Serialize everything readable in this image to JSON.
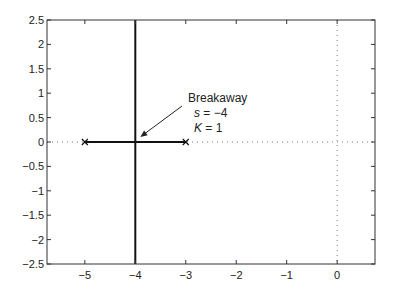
{
  "chart_data": {
    "type": "line",
    "title": "",
    "xlabel": "",
    "ylabel": "",
    "xlim": [
      -5.75,
      0.75
    ],
    "ylim": [
      -2.5,
      2.5
    ],
    "grid": false,
    "legend": null,
    "x_ticks": [
      -5,
      -4,
      -3,
      -2,
      -1,
      0
    ],
    "x_tick_labels": [
      "−5",
      "−4",
      "−3",
      "−2",
      "−1",
      "0"
    ],
    "y_ticks": [
      2.5,
      2,
      1.5,
      1,
      0.5,
      0,
      -0.5,
      -1,
      -1.5,
      -2,
      -2.5
    ],
    "y_tick_labels": [
      "2.5",
      "2",
      "1.5",
      "1",
      "0.5",
      "0",
      "−0.5",
      "−1",
      "−1.5",
      "−2",
      "−2.5"
    ],
    "series": [
      {
        "name": "real-axis locus",
        "x": [
          -5,
          -3
        ],
        "y": [
          0,
          0
        ],
        "style": "solid-thick"
      },
      {
        "name": "vertical branch",
        "x": [
          -4,
          -4
        ],
        "y": [
          -2.5,
          2.5
        ],
        "style": "solid-thick"
      }
    ],
    "poles": [
      {
        "x": -5,
        "y": 0,
        "marker": "x"
      },
      {
        "x": -3,
        "y": 0,
        "marker": "x"
      }
    ],
    "reference_lines": [
      {
        "orientation": "horizontal",
        "value": 0,
        "style": "dotted"
      },
      {
        "orientation": "vertical",
        "value": 0,
        "style": "dotted"
      }
    ],
    "annotations": [
      {
        "lines": [
          "Breakaway",
          "s = −4",
          "K = 1"
        ],
        "arrow_to": {
          "x": -4,
          "y": 0
        }
      }
    ]
  },
  "annotation": {
    "line1": "Breakaway",
    "line2_var": "s",
    "line2_rest": " = −4",
    "line3_var": "K",
    "line3_rest": " = 1"
  }
}
